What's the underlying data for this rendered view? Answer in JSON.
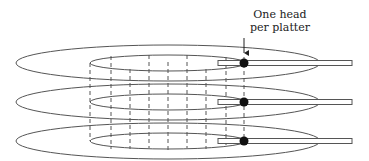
{
  "diagram": {
    "title_label": {
      "line1": "One head",
      "line2": "per platter"
    },
    "platters": [
      {
        "id": "platter-1",
        "cy": 63
      },
      {
        "id": "platter-2",
        "cy": 102
      },
      {
        "id": "platter-3",
        "cy": 141
      }
    ],
    "colors": {
      "stroke": "#555555",
      "head": "#111111",
      "background": "#ffffff"
    }
  }
}
